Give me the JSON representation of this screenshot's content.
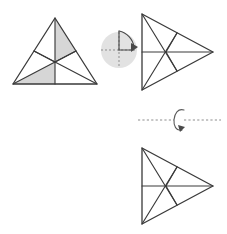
{
  "figure": {
    "background_color": "#ffffff",
    "stroke_color": "#3a3a3a",
    "shade_color": "#d6d6d6",
    "icon_disc_color": "#e2e2e2",
    "dash_color": "#8d8d8d"
  },
  "shapes": {
    "source_triangle": {
      "name": "equilateral-triangle-up",
      "orientation": "apex-up",
      "vertices": [
        [
          55,
          18
        ],
        [
          13,
          84
        ],
        [
          97,
          84
        ]
      ],
      "centroid": [
        55,
        62
      ],
      "midpoints": {
        "left_side": [
          34,
          51
        ],
        "right_side": [
          76,
          51
        ],
        "base": [
          55,
          84
        ]
      },
      "median_count": 3,
      "sector_count": 6,
      "shaded_sectors": [
        {
          "id": "top-right-sector",
          "points": [
            [
              55,
              18
            ],
            [
              76,
              51
            ],
            [
              55,
              62
            ]
          ],
          "fill": "#d6d6d6"
        },
        {
          "id": "bottom-left-sector",
          "points": [
            [
              55,
              62
            ],
            [
              13,
              84
            ],
            [
              55,
              84
            ]
          ],
          "fill": "#d6d6d6"
        }
      ]
    },
    "rotated_triangle": {
      "name": "equilateral-triangle-right-top",
      "orientation": "apex-right",
      "vertices": [
        [
          142,
          14
        ],
        [
          142,
          90
        ],
        [
          213,
          52
        ]
      ],
      "centroid": [
        166,
        52
      ],
      "midpoints": {
        "top_side": [
          177,
          33
        ],
        "bottom_side": [
          177,
          71
        ],
        "left_side": [
          142,
          52
        ]
      },
      "median_count": 3,
      "sector_count": 6,
      "shaded_sectors": []
    },
    "flipped_triangle": {
      "name": "equilateral-triangle-right-bottom",
      "orientation": "apex-right",
      "vertices": [
        [
          142,
          148
        ],
        [
          142,
          224
        ],
        [
          213,
          186
        ]
      ],
      "centroid": [
        166,
        186
      ],
      "midpoints": {
        "top_side": [
          177,
          167
        ],
        "bottom_side": [
          177,
          205
        ],
        "left_side": [
          142,
          186
        ]
      },
      "median_count": 3,
      "sector_count": 6,
      "shaded_sectors": []
    }
  },
  "operators": {
    "rotation": {
      "icon_name": "rotate-90-clockwise-icon",
      "label": "",
      "center": [
        119,
        50
      ],
      "radius": 18,
      "direction": "clockwise",
      "angle_degrees": 90,
      "arc_quadrant": "upper-right",
      "has_crosshair": true,
      "crosshair_style": "dashed"
    },
    "reflection": {
      "icon_name": "flip-horizontal-axis-icon",
      "label": "",
      "axis_start": [
        138,
        120
      ],
      "axis_end": [
        221,
        120
      ],
      "axis_style": "dashed",
      "loop_center": [
        179,
        119
      ],
      "direction": "flip-over-horizontal-axis"
    }
  }
}
